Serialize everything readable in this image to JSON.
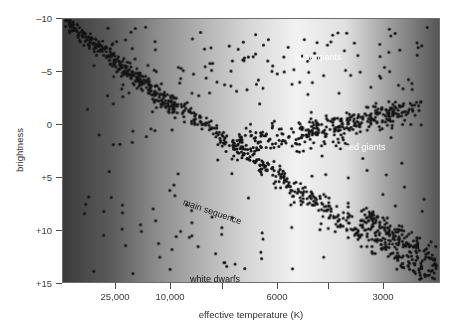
{
  "chart_data": {
    "type": "scatter",
    "title": "",
    "subtitle": "",
    "xlabel": "effective temperature (K)",
    "ylabel": "brightness",
    "grid": false,
    "legend_position": "none",
    "x_scale": "log-reversed",
    "xlim": [
      40000,
      2200
    ],
    "ylim": [
      -10,
      15
    ],
    "y_inverted": true,
    "xticks": [
      {
        "label": "25,000",
        "px": 115
      },
      {
        "label": "10,000",
        "px": 170
      },
      {
        "label": "",
        "px": 222
      },
      {
        "label": "6000",
        "px": 277
      },
      {
        "label": "",
        "px": 328
      },
      {
        "label": "3000",
        "px": 383
      }
    ],
    "yticks": [
      {
        "label": "–10",
        "value": -10
      },
      {
        "label": "–5",
        "value": -5
      },
      {
        "label": "0",
        "value": 0
      },
      {
        "label": "+5",
        "value": 5
      },
      {
        "label": "+10",
        "value": 10
      },
      {
        "label": "+15",
        "value": 15
      }
    ],
    "annotations": [
      {
        "id": "supergiants",
        "text": "supergiants",
        "color": "#ffffff",
        "style": "light"
      },
      {
        "id": "red-giants",
        "text": "red giants",
        "color": "#ffffff",
        "style": "light"
      },
      {
        "id": "main-sequence",
        "text": "main sequence",
        "color": "#17171a",
        "style": "dark",
        "rotation_deg": 19
      },
      {
        "id": "white-dwarfs",
        "text": "white dwarfs",
        "color": "#17171a",
        "style": "dark"
      }
    ],
    "marker": {
      "shape": "circle",
      "color": "#141414",
      "size_px": 3
    },
    "background": {
      "type": "horizontal-grayscale-gradient",
      "stops": [
        "#3b3b3b",
        "#5a5a5a",
        "#8c8c8c",
        "#b4b4b4",
        "#d8d8d8",
        "#f2f2f2",
        "#e0e0e0",
        "#9a9a9a",
        "#565656"
      ]
    },
    "series": [
      {
        "name": "main sequence",
        "points": [
          [
            14,
            6
          ],
          [
            16,
            12
          ],
          [
            18,
            3
          ],
          [
            20,
            18
          ],
          [
            22,
            9
          ],
          [
            24,
            24
          ],
          [
            26,
            15
          ],
          [
            28,
            30
          ],
          [
            30,
            21
          ],
          [
            31,
            36
          ],
          [
            33,
            27
          ],
          [
            35,
            42
          ],
          [
            37,
            33
          ],
          [
            38,
            48
          ],
          [
            40,
            39
          ],
          [
            42,
            54
          ],
          [
            44,
            45
          ],
          [
            45,
            60
          ],
          [
            47,
            51
          ],
          [
            49,
            66
          ],
          [
            51,
            57
          ],
          [
            52,
            72
          ],
          [
            54,
            63
          ],
          [
            56,
            78
          ],
          [
            58,
            69
          ],
          [
            59,
            84
          ],
          [
            61,
            75
          ],
          [
            63,
            90
          ],
          [
            65,
            81
          ],
          [
            66,
            96
          ],
          [
            68,
            87
          ],
          [
            70,
            102
          ],
          [
            72,
            93
          ],
          [
            73,
            108
          ],
          [
            75,
            99
          ],
          [
            77,
            114
          ],
          [
            79,
            105
          ],
          [
            80,
            120
          ],
          [
            82,
            111
          ],
          [
            84,
            126
          ],
          [
            86,
            117
          ],
          [
            88,
            132
          ],
          [
            90,
            123
          ],
          [
            92,
            138
          ],
          [
            94,
            129
          ],
          [
            96,
            144
          ],
          [
            98,
            135
          ],
          [
            100,
            150
          ],
          [
            102,
            141
          ],
          [
            104,
            156
          ],
          [
            106,
            147
          ],
          [
            108,
            162
          ],
          [
            110,
            153
          ],
          [
            112,
            168
          ],
          [
            114,
            159
          ],
          [
            116,
            174
          ],
          [
            118,
            165
          ],
          [
            120,
            180
          ],
          [
            123,
            171
          ],
          [
            126,
            186
          ],
          [
            129,
            177
          ],
          [
            132,
            192
          ],
          [
            135,
            183
          ],
          [
            138,
            198
          ],
          [
            141,
            189
          ],
          [
            144,
            204
          ],
          [
            147,
            195
          ],
          [
            150,
            210
          ],
          [
            153,
            201
          ],
          [
            156,
            216
          ],
          [
            160,
            207
          ],
          [
            164,
            222
          ],
          [
            168,
            213
          ],
          [
            172,
            228
          ],
          [
            176,
            219
          ],
          [
            180,
            234
          ],
          [
            184,
            225
          ],
          [
            188,
            240
          ],
          [
            192,
            231
          ],
          [
            196,
            246
          ],
          [
            200,
            237
          ],
          [
            205,
            252
          ],
          [
            210,
            243
          ],
          [
            215,
            258
          ],
          [
            220,
            249
          ],
          [
            225,
            264
          ],
          [
            230,
            255
          ],
          [
            235,
            270
          ],
          [
            240,
            261
          ],
          [
            245,
            276
          ],
          [
            250,
            267
          ],
          [
            255,
            282
          ],
          [
            260,
            273
          ],
          [
            265,
            288
          ],
          [
            270,
            279
          ],
          [
            275,
            294
          ],
          [
            280,
            285
          ],
          [
            285,
            300
          ],
          [
            290,
            291
          ],
          [
            295,
            306
          ],
          [
            300,
            297
          ],
          [
            305,
            312
          ],
          [
            310,
            303
          ],
          [
            315,
            318
          ],
          [
            320,
            309
          ],
          [
            325,
            324
          ],
          [
            330,
            315
          ],
          [
            335,
            330
          ],
          [
            340,
            321
          ],
          [
            345,
            336
          ],
          [
            350,
            327
          ],
          [
            355,
            342
          ],
          [
            360,
            333
          ],
          [
            365,
            348
          ],
          [
            370,
            339
          ],
          [
            375,
            354
          ],
          [
            380,
            345
          ],
          [
            385,
            360
          ],
          [
            390,
            351
          ],
          [
            395,
            366
          ]
        ]
      },
      {
        "name": "red giants",
        "points": [
          [
            236,
            115
          ],
          [
            242,
            108
          ],
          [
            248,
            120
          ],
          [
            254,
            104
          ],
          [
            260,
            116
          ],
          [
            266,
            100
          ],
          [
            272,
            112
          ],
          [
            278,
            96
          ],
          [
            284,
            110
          ],
          [
            290,
            94
          ],
          [
            296,
            106
          ],
          [
            302,
            90
          ],
          [
            308,
            104
          ],
          [
            314,
            88
          ],
          [
            320,
            100
          ],
          [
            326,
            86
          ],
          [
            332,
            98
          ],
          [
            338,
            84
          ],
          [
            344,
            96
          ],
          [
            350,
            82
          ]
        ]
      },
      {
        "name": "supergiants",
        "points": [
          [
            180,
            40
          ],
          [
            200,
            55
          ],
          [
            225,
            35
          ],
          [
            250,
            60
          ],
          [
            275,
            45
          ],
          [
            300,
            65
          ],
          [
            325,
            50
          ],
          [
            350,
            70
          ],
          [
            375,
            42
          ],
          [
            400,
            58
          ]
        ]
      },
      {
        "name": "white dwarfs",
        "points": [
          [
            100,
            250
          ],
          [
            130,
            262
          ],
          [
            160,
            258
          ],
          [
            190,
            268
          ],
          [
            150,
            244
          ],
          [
            175,
            272
          ]
        ]
      }
    ]
  }
}
